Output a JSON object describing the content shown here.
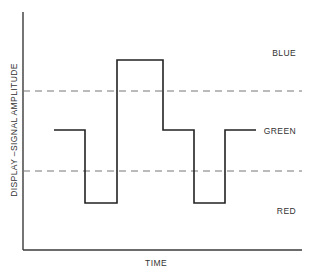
{
  "diagram": {
    "y_axis_label": "DISPLAY –SIGNAL AMPLITUDE",
    "x_axis_label": "TIME",
    "levels": [
      {
        "name": "blue",
        "label": "BLUE"
      },
      {
        "name": "green",
        "label": "GREEN"
      },
      {
        "name": "red",
        "label": "RED"
      }
    ],
    "thresholds": [
      "upper-threshold",
      "lower-threshold"
    ],
    "signal_sequence": [
      "GREEN",
      "RED",
      "BLUE",
      "GREEN",
      "RED",
      "GREEN"
    ],
    "colors": {
      "axis": "#3a3a3a",
      "signal": "#222222",
      "threshold": "#777777",
      "text": "#333333"
    }
  }
}
